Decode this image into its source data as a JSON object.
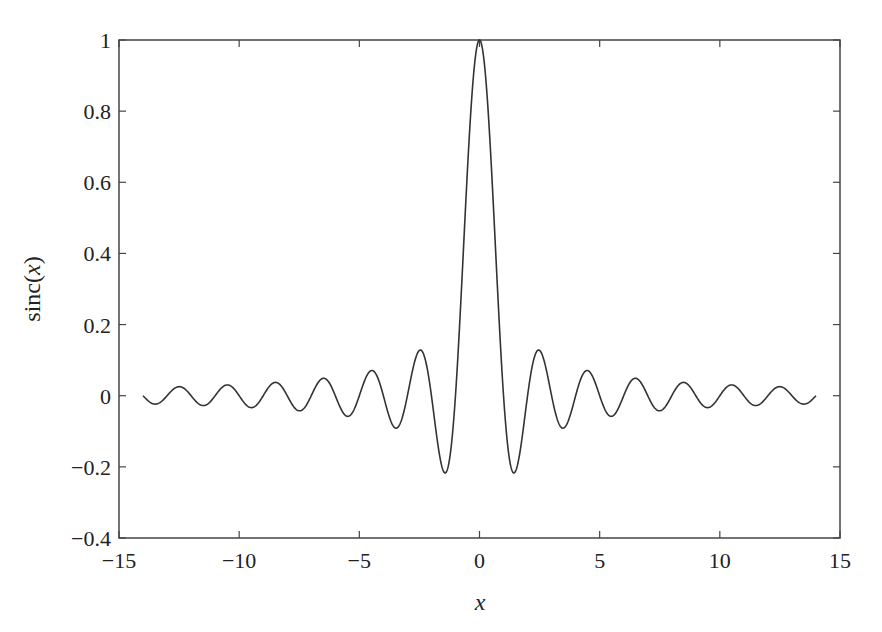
{
  "chart_data": {
    "type": "line",
    "title": "",
    "xlabel": "x",
    "ylabel_prefix": "sinc(",
    "ylabel_var": "x",
    "ylabel_suffix": ")",
    "xlim": [
      -15,
      15
    ],
    "ylim": [
      -0.4,
      1
    ],
    "xticks": [
      -15,
      -10,
      -5,
      0,
      5,
      10,
      15
    ],
    "xtick_labels": [
      "−15",
      "−10",
      "−5",
      "0",
      "5",
      "10",
      "15"
    ],
    "yticks": [
      -0.4,
      -0.2,
      0,
      0.2,
      0.4,
      0.6,
      0.8,
      1
    ],
    "ytick_labels": [
      "−0.4",
      "−0.2",
      "0",
      "0.2",
      "0.4",
      "0.6",
      "0.8",
      "1"
    ],
    "grid": false,
    "legend": "none",
    "series": [
      {
        "name": "sinc(x)",
        "function": "sin(pi*x)/(pi*x)",
        "x_range": [
          -14,
          14
        ],
        "color": "#333333",
        "key_points": [
          {
            "x": -1.43,
            "y": -0.217
          },
          {
            "x": -2.46,
            "y": 0.128
          },
          {
            "x": -3.47,
            "y": -0.091
          },
          {
            "x": -4.48,
            "y": 0.071
          },
          {
            "x": 0,
            "y": 1
          },
          {
            "x": 1.43,
            "y": -0.217
          },
          {
            "x": 2.46,
            "y": 0.128
          },
          {
            "x": 3.47,
            "y": -0.091
          },
          {
            "x": 4.48,
            "y": 0.071
          }
        ]
      }
    ]
  }
}
